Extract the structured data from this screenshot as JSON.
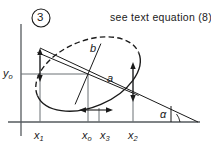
{
  "figure": {
    "number": "3",
    "caption": "see text equation (8)",
    "labels": {
      "semi_major": "a",
      "semi_minor": "b",
      "angle": "α",
      "y_origin_base": "y",
      "y_origin_sub": "o",
      "x1_base": "x",
      "x1_sub": "1",
      "x0_base": "x",
      "x0_sub": "o",
      "x3_base": "x",
      "x3_sub": "3",
      "x2_base": "x",
      "x2_sub": "2"
    },
    "geometry": {
      "y_axis_x": 21,
      "x_axis_y": 122,
      "center_x": 88,
      "center_y": 74,
      "semi_major_px": 55,
      "semi_minor_px": 33,
      "rotation_deg": -23,
      "x1": 40,
      "x0": 88,
      "x3": 99,
      "x2": 133,
      "y0": 74,
      "incline_left_x": 40,
      "incline_left_y": 48,
      "incline_right_x": 198,
      "incline_right_y": 122
    },
    "colors": {
      "ink": "#1a1a1a",
      "axis": "#555a5e",
      "grid": "#6b7075",
      "paper": "#ffffff"
    }
  }
}
